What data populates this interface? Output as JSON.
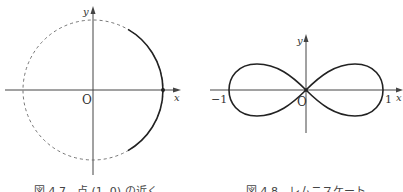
{
  "figures": [
    {
      "id": "fig-4-7",
      "caption": "図 4.7　点 (1, 0) の近く",
      "axis_labels": {
        "x": "x",
        "y": "y",
        "origin": "O"
      },
      "description": "Unit circle (dashed) with the solid arc near the point (1, 0) highlighted; point (1, 0) marked with a dot"
    },
    {
      "id": "fig-4-8",
      "caption": "図 4.8　レムニスケート",
      "axis_labels": {
        "x": "x",
        "y": "y",
        "origin": "O"
      },
      "ticks": {
        "left": "−1",
        "right": "1"
      },
      "description": "Lemniscate curve crossing at the origin, spanning x from −1 to 1"
    }
  ],
  "colors": {
    "stroke": "#333333",
    "background": "#ffffff"
  }
}
